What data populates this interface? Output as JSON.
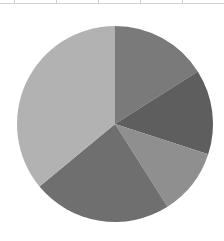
{
  "chart_data": {
    "type": "pie",
    "title": "",
    "start_angle_deg": 0,
    "direction": "clockwise",
    "center": [
      115,
      124
    ],
    "radius": 98,
    "slices": [
      {
        "label": "",
        "value": 16,
        "color": "#7a7a7a"
      },
      {
        "label": "",
        "value": 14,
        "color": "#5e5e5e"
      },
      {
        "label": "",
        "value": 11,
        "color": "#8f8f8f"
      },
      {
        "label": "",
        "value": 23,
        "color": "#6f6f6f"
      },
      {
        "label": "",
        "value": 36,
        "color": "#b2b2b2"
      }
    ],
    "legend": []
  }
}
